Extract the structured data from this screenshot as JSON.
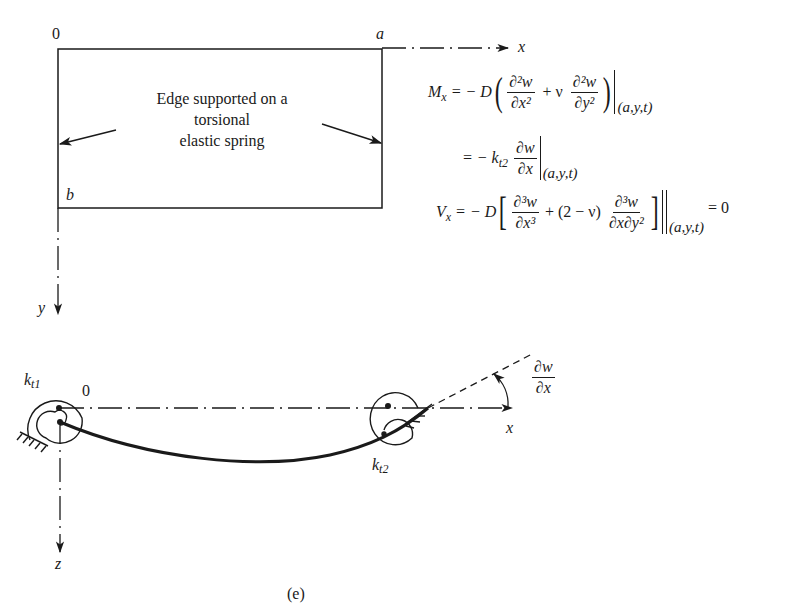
{
  "figure": {
    "panel_label": "(e)",
    "top_diagram": {
      "origin_label": "0",
      "corner_a_label": "a",
      "corner_b_label": "b",
      "x_axis_label": "x",
      "y_axis_label": "y",
      "annotation": [
        "Edge supported on a",
        "torsional",
        "elastic spring"
      ]
    },
    "equations": {
      "mx": {
        "lhs": "M",
        "lhs_sub": "x",
        "eq_sign": "= − D",
        "term1_num": "∂²w",
        "term1_den": "∂x²",
        "plus_nu": "+ ν",
        "term2_num": "∂²w",
        "term2_den": "∂y²",
        "eval_at": "(a,y,t)"
      },
      "mx_line2": {
        "eq_sign": "= − k",
        "k_sub": "t2",
        "num": "∂w",
        "den": "∂x",
        "eval_at": "(a,y,t)"
      },
      "vx": {
        "lhs": "V",
        "lhs_sub": "x",
        "eq_sign": "= − D",
        "term1_num": "∂³w",
        "term1_den": "∂x³",
        "plus_coeff": "+ (2 − ν)",
        "term2_num": "∂³w",
        "term2_den": "∂x∂y²",
        "eval_at": "(a,y,t)",
        "rhs": "= 0"
      }
    },
    "bottom_diagram": {
      "spring1_label": "k",
      "spring1_sub": "t1",
      "origin_label": "0",
      "spring2_label": "k",
      "spring2_sub": "t2",
      "x_axis_label": "x",
      "z_axis_label": "z",
      "slope_num": "∂w",
      "slope_den": "∂x"
    }
  }
}
